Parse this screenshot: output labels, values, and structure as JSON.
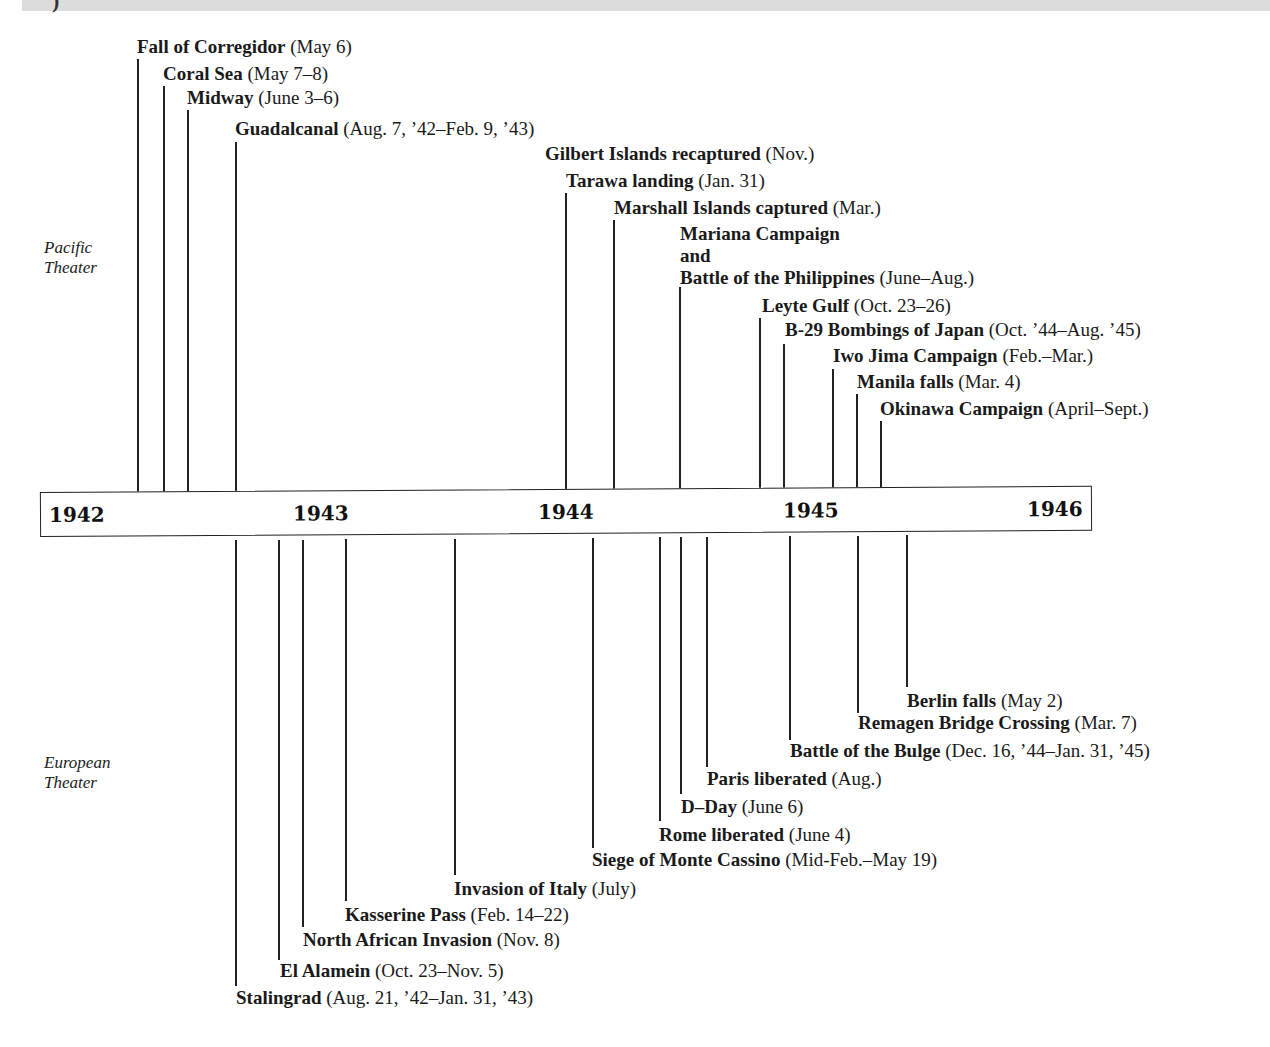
{
  "header_fragment": ")",
  "theaters": {
    "pacific": {
      "label_line1": "Pacific",
      "label_line2": "Theater"
    },
    "european": {
      "label_line1": "European",
      "label_line2": "Theater"
    }
  },
  "timeline": {
    "years": [
      "1942",
      "1943",
      "1944",
      "1945",
      "1946"
    ]
  },
  "pacific_events": [
    {
      "name": "Fall of Corregidor",
      "date": "(May 6)"
    },
    {
      "name": "Coral Sea",
      "date": "(May 7–8)"
    },
    {
      "name": "Midway",
      "date": "(June 3–6)"
    },
    {
      "name": "Guadalcanal",
      "date": "(Aug. 7, ’42–Feb. 9, ’43)"
    },
    {
      "name": "Gilbert Islands recaptured",
      "date": "(Nov.)"
    },
    {
      "name": "Tarawa landing",
      "date": "(Jan. 31)"
    },
    {
      "name": "Marshall Islands captured",
      "date": "(Mar.)"
    },
    {
      "name_line1": "Mariana Campaign",
      "name_line2": "and",
      "name": "Battle of the Philippines",
      "date": "(June–Aug.)"
    },
    {
      "name": "Leyte Gulf",
      "date": "(Oct. 23–26)"
    },
    {
      "name": "B-29 Bombings of Japan",
      "date": "(Oct. ’44–Aug. ’45)"
    },
    {
      "name": "Iwo Jima Campaign",
      "date": "(Feb.–Mar.)"
    },
    {
      "name": "Manila falls",
      "date": "(Mar. 4)"
    },
    {
      "name": "Okinawa Campaign",
      "date": "(April–Sept.)"
    }
  ],
  "european_events": [
    {
      "name": "Berlin falls",
      "date": "(May 2)"
    },
    {
      "name": "Remagen Bridge Crossing",
      "date": "(Mar. 7)"
    },
    {
      "name": "Battle of the Bulge",
      "date": "(Dec. 16, ’44–Jan. 31, ’45)"
    },
    {
      "name": "Paris liberated",
      "date": "(Aug.)"
    },
    {
      "name": "D–Day",
      "date": "(June 6)"
    },
    {
      "name": "Rome liberated",
      "date": "(June 4)"
    },
    {
      "name": "Siege of Monte Cassino",
      "date": "(Mid-Feb.–May 19)"
    },
    {
      "name": "Invasion of Italy",
      "date": "(July)"
    },
    {
      "name": "Kasserine Pass",
      "date": "(Feb. 14–22)"
    },
    {
      "name": "North African Invasion",
      "date": "(Nov. 8)"
    },
    {
      "name": "El Alamein",
      "date": "(Oct. 23–Nov. 5)"
    },
    {
      "name": "Stalingrad",
      "date": "(Aug. 21, ’42–Jan. 31, ’43)"
    }
  ]
}
